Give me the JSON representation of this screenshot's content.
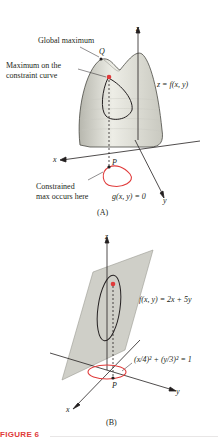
{
  "figure": {
    "caption": "FIGURE 6",
    "accent_color": "#e03a3a",
    "panel_a": {
      "label": "(A)",
      "annotations": {
        "global_max": "Global maximum",
        "Q": "Q",
        "max_constraint_1": "Maximum on the",
        "max_constraint_2": "constraint curve",
        "surface": "z = f(x, y)",
        "P": "P",
        "constrained_1": "Constrained",
        "constrained_2": "max occurs here",
        "constraint_eq": "g(x, y) = 0"
      },
      "axes": {
        "x": "x",
        "y": "y",
        "z": "z"
      }
    },
    "panel_b": {
      "label": "(B)",
      "annotations": {
        "plane": "f(x, y) = 2x + 5y",
        "ellipse": "(x/4)² + (y/3)² = 1",
        "P": "P"
      },
      "axes": {
        "x": "x",
        "y": "y",
        "z": "z"
      }
    }
  }
}
